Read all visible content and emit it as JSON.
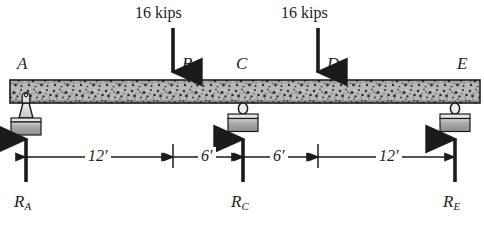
{
  "figure": {
    "beam": {
      "material_hatch": "stippled-concrete",
      "fill_color": "#b6b6b6",
      "edge_color": "#1b1b1b",
      "left_x_ft": 0,
      "right_x_ft": 36
    },
    "points": [
      {
        "id": "A",
        "label": "A",
        "x_ft": 0,
        "role": "pin-support"
      },
      {
        "id": "B",
        "label": "B",
        "x_ft": 12,
        "role": "load-point"
      },
      {
        "id": "C",
        "label": "C",
        "x_ft": 18,
        "role": "roller-support"
      },
      {
        "id": "D",
        "label": "D",
        "x_ft": 24,
        "role": "load-point"
      },
      {
        "id": "E",
        "label": "E",
        "x_ft": 36,
        "role": "roller-support"
      }
    ],
    "loads": [
      {
        "at": "B",
        "label": "16 kips",
        "magnitude": 16,
        "units": "kips",
        "direction": "down"
      },
      {
        "at": "D",
        "label": "16 kips",
        "magnitude": 16,
        "units": "kips",
        "direction": "down"
      }
    ],
    "reactions": [
      {
        "at": "A",
        "symbol": "R",
        "subscript": "A",
        "direction": "up"
      },
      {
        "at": "C",
        "symbol": "R",
        "subscript": "C",
        "direction": "up"
      },
      {
        "at": "E",
        "symbol": "R",
        "subscript": "E",
        "direction": "up"
      }
    ],
    "dimensions": [
      {
        "label": "12′",
        "value": 12,
        "units": "ft",
        "from": "A",
        "to": "B"
      },
      {
        "label": "6′",
        "value": 6,
        "units": "ft",
        "from": "B",
        "to": "C"
      },
      {
        "label": "6′",
        "value": 6,
        "units": "ft",
        "from": "C",
        "to": "D"
      },
      {
        "label": "12′",
        "value": 12,
        "units": "ft",
        "from": "D",
        "to": "E"
      }
    ],
    "colors": {
      "ink": "#1b1b1b",
      "beam_fill": "#b6b6b6",
      "support_fill": "#c9c9c9",
      "base_block": "#9a9a9a",
      "background": "#ffffff"
    }
  }
}
